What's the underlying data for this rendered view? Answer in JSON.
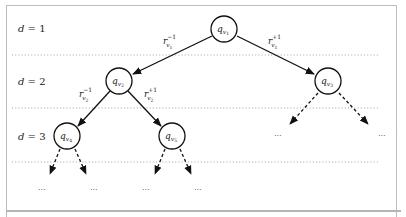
{
  "diagram": {
    "type": "binary-tree",
    "levels": [
      {
        "label": "d = 1",
        "y": 29
      },
      {
        "label": "d = 2",
        "y": 81
      },
      {
        "label": "d = 3",
        "y": 136
      }
    ],
    "level_separators_y": [
      55,
      108,
      162
    ],
    "nodes": [
      {
        "id": "v1",
        "base": "q",
        "sub": "v",
        "subsub": "1",
        "cx": 224,
        "cy": 29
      },
      {
        "id": "v2",
        "base": "q",
        "sub": "v",
        "subsub": "2",
        "cx": 119,
        "cy": 81
      },
      {
        "id": "v3",
        "base": "q",
        "sub": "v",
        "subsub": "3",
        "cx": 328,
        "cy": 81
      },
      {
        "id": "v4",
        "base": "q",
        "sub": "v",
        "subsub": "4",
        "cx": 67,
        "cy": 136
      },
      {
        "id": "v5",
        "base": "q",
        "sub": "v",
        "subsub": "5",
        "cx": 172,
        "cy": 136
      }
    ],
    "edges": [
      {
        "from": "v1",
        "to": "v2",
        "style": "solid",
        "label": {
          "base": "r",
          "sup": "−1",
          "sub": "v",
          "subsub": "1"
        }
      },
      {
        "from": "v1",
        "to": "v3",
        "style": "solid",
        "label": {
          "base": "r",
          "sup": "+1",
          "sub": "v",
          "subsub": "1"
        }
      },
      {
        "from": "v2",
        "to": "v4",
        "style": "solid",
        "label": {
          "base": "r",
          "sup": "−1",
          "sub": "v",
          "subsub": "2"
        }
      },
      {
        "from": "v2",
        "to": "v5",
        "style": "solid",
        "label": {
          "base": "r",
          "sup": "+1",
          "sub": "v",
          "subsub": "2"
        }
      },
      {
        "from": "v3",
        "to": "…",
        "style": "dashed"
      },
      {
        "from": "v3",
        "to": "…",
        "style": "dashed"
      },
      {
        "from": "v4",
        "to": "…",
        "style": "dashed"
      },
      {
        "from": "v4",
        "to": "…",
        "style": "dashed"
      },
      {
        "from": "v5",
        "to": "…",
        "style": "dashed"
      },
      {
        "from": "v5",
        "to": "…",
        "style": "dashed"
      }
    ],
    "ellipsis": "...",
    "edge_labels": {
      "e12": {
        "base": "r",
        "sup": "−1",
        "sub": "v",
        "subsub": "1"
      },
      "e13": {
        "base": "r",
        "sup": "+1",
        "sub": "v",
        "subsub": "1"
      },
      "e24": {
        "base": "r",
        "sup": "−1",
        "sub": "v",
        "subsub": "2"
      },
      "e25": {
        "base": "r",
        "sup": "+1",
        "sub": "v",
        "subsub": "2"
      }
    },
    "colors": {
      "stroke": "#111111",
      "separator": "#9a9a9a",
      "frame": "#bdbdbd",
      "background": "#ffffff"
    }
  }
}
